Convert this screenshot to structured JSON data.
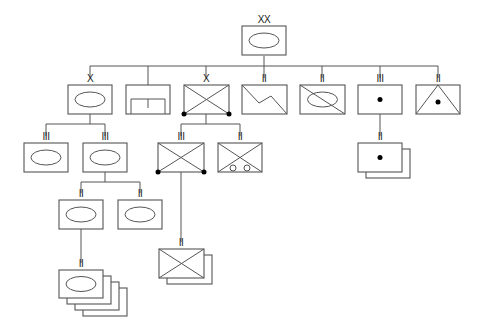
{
  "diagram": {
    "type": "military-organization-chart",
    "colors": {
      "line": "#555555",
      "dot": "#000000",
      "background": "#ffffff"
    },
    "units": [
      {
        "id": "division-hq",
        "echelon": "XX",
        "symbol": "armor",
        "x": 256,
        "y": 26
      },
      {
        "id": "brigade-armor",
        "echelon": "X",
        "symbol": "armor",
        "x": 90,
        "y": 85,
        "parent": "division-hq"
      },
      {
        "id": "engineer",
        "echelon": "I",
        "symbol": "engineer",
        "x": 148,
        "y": 85,
        "parent": "division-hq"
      },
      {
        "id": "brigade-airborne-infantry",
        "echelon": "X",
        "symbol": "airborne-infantry",
        "x": 206,
        "y": 85,
        "parent": "division-hq"
      },
      {
        "id": "signal-battalion",
        "echelon": "II",
        "symbol": "signal",
        "x": 264,
        "y": 85,
        "parent": "division-hq"
      },
      {
        "id": "armored-cavalry-battalion",
        "echelon": "II",
        "symbol": "armored-cavalry",
        "x": 322,
        "y": 85,
        "parent": "division-hq"
      },
      {
        "id": "artillery-regiment",
        "echelon": "III",
        "symbol": "artillery",
        "x": 380,
        "y": 85,
        "parent": "division-hq"
      },
      {
        "id": "air-defense-battalion",
        "echelon": "II",
        "symbol": "air-defense-artillery",
        "x": 438,
        "y": 85,
        "parent": "division-hq"
      },
      {
        "id": "armor-regiment-1",
        "echelon": "III",
        "symbol": "armor",
        "x": 46,
        "y": 143,
        "parent": "brigade-armor"
      },
      {
        "id": "armor-regiment-2",
        "echelon": "III",
        "symbol": "armor",
        "x": 105,
        "y": 143,
        "parent": "brigade-armor"
      },
      {
        "id": "airborne-infantry-regiment",
        "echelon": "III",
        "symbol": "airborne-infantry",
        "x": 181,
        "y": 143,
        "parent": "brigade-airborne-infantry"
      },
      {
        "id": "wheeled-infantry-battalion",
        "echelon": "II",
        "symbol": "wheeled-infantry",
        "x": 240,
        "y": 143,
        "parent": "brigade-airborne-infantry"
      },
      {
        "id": "artillery-battalions",
        "echelon": "II",
        "symbol": "artillery",
        "x": 380,
        "y": 143,
        "parent": "artillery-regiment",
        "stack": 2
      },
      {
        "id": "armor-battalion-1",
        "echelon": "II",
        "symbol": "armor",
        "x": 81,
        "y": 200,
        "parent": "armor-regiment-2"
      },
      {
        "id": "armor-battalion-2",
        "echelon": "II",
        "symbol": "armor",
        "x": 140,
        "y": 200,
        "parent": "armor-regiment-2"
      },
      {
        "id": "infantry-battalions",
        "echelon": "II",
        "symbol": "infantry",
        "x": 181,
        "y": 249,
        "parent": "airborne-infantry-regiment",
        "stack": 2
      },
      {
        "id": "armor-battalions",
        "echelon": "II",
        "symbol": "armor",
        "x": 81,
        "y": 270,
        "parent": "armor-battalion-1",
        "stack": 4
      }
    ],
    "labels": {
      "division": "XX",
      "col1": "X",
      "col2": "I",
      "col3": "X",
      "col4": "II",
      "col5": "II",
      "col6": "III",
      "col7": "II",
      "r3a": "III",
      "r3b": "III",
      "r3c": "III",
      "r3d": "II",
      "r3e": "II",
      "r4a": "II",
      "r4b": "II",
      "r5a": "II",
      "r6a": "II"
    }
  }
}
